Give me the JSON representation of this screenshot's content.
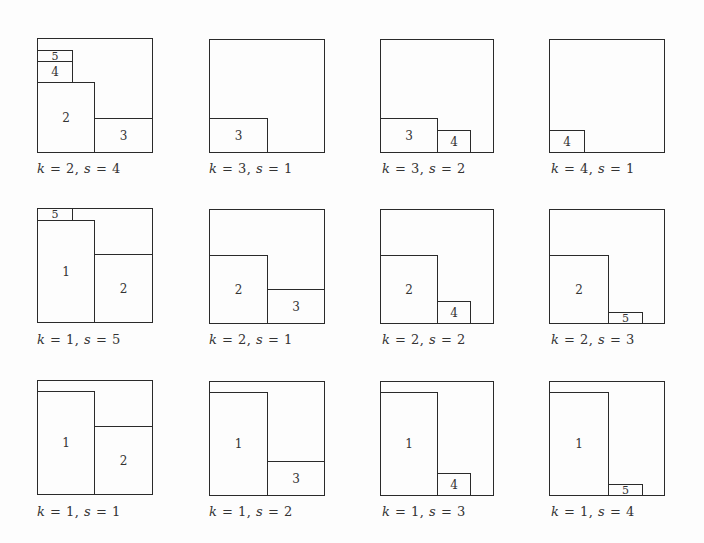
{
  "figure": {
    "panels": [
      {
        "caption": "k = 2, s = 4",
        "k": 2,
        "s": 4,
        "outer": {
          "x": 37,
          "y": 38,
          "w": 116,
          "h": 115
        },
        "rects": [
          {
            "label": "5",
            "x": 37,
            "y": 50,
            "w": 36,
            "h": 12
          },
          {
            "label": "4",
            "x": 37,
            "y": 61,
            "w": 36,
            "h": 22
          },
          {
            "label": "2",
            "x": 37,
            "y": 82,
            "w": 58,
            "h": 71
          },
          {
            "label": "3",
            "x": 94,
            "y": 118,
            "w": 59,
            "h": 35
          }
        ]
      },
      {
        "caption": "k = 3, s = 1",
        "k": 3,
        "s": 1,
        "outer": {
          "x": 209,
          "y": 39,
          "w": 116,
          "h": 114
        },
        "rects": [
          {
            "label": "3",
            "x": 209,
            "y": 118,
            "w": 59,
            "h": 35
          }
        ]
      },
      {
        "caption": "k = 3, s = 2",
        "k": 3,
        "s": 2,
        "outer": {
          "x": 380,
          "y": 39,
          "w": 114,
          "h": 114
        },
        "rects": [
          {
            "label": "3",
            "x": 380,
            "y": 118,
            "w": 58,
            "h": 35
          },
          {
            "label": "4",
            "x": 437,
            "y": 130,
            "w": 34,
            "h": 23
          }
        ]
      },
      {
        "caption": "k = 4, s = 1",
        "k": 4,
        "s": 1,
        "outer": {
          "x": 549,
          "y": 39,
          "w": 116,
          "h": 114
        },
        "rects": [
          {
            "label": "4",
            "x": 549,
            "y": 130,
            "w": 36,
            "h": 23
          }
        ]
      },
      {
        "caption": "k = 1, s = 5",
        "k": 1,
        "s": 5,
        "outer": {
          "x": 37,
          "y": 208,
          "w": 116,
          "h": 115
        },
        "rects": [
          {
            "label": "5",
            "x": 37,
            "y": 208,
            "w": 36,
            "h": 13
          },
          {
            "label": "1",
            "x": 37,
            "y": 220,
            "w": 58,
            "h": 103
          },
          {
            "label": "2",
            "x": 94,
            "y": 254,
            "w": 59,
            "h": 69
          }
        ]
      },
      {
        "caption": "k = 2, s = 1",
        "k": 2,
        "s": 1,
        "outer": {
          "x": 209,
          "y": 209,
          "w": 116,
          "h": 115
        },
        "rects": [
          {
            "label": "2",
            "x": 209,
            "y": 255,
            "w": 59,
            "h": 69
          },
          {
            "label": "3",
            "x": 267,
            "y": 289,
            "w": 58,
            "h": 35
          }
        ]
      },
      {
        "caption": "k = 2, s = 2",
        "k": 2,
        "s": 2,
        "outer": {
          "x": 380,
          "y": 209,
          "w": 114,
          "h": 115
        },
        "rects": [
          {
            "label": "2",
            "x": 380,
            "y": 255,
            "w": 58,
            "h": 69
          },
          {
            "label": "4",
            "x": 437,
            "y": 301,
            "w": 34,
            "h": 23
          }
        ]
      },
      {
        "caption": "k = 2, s = 3",
        "k": 2,
        "s": 3,
        "outer": {
          "x": 549,
          "y": 209,
          "w": 116,
          "h": 115
        },
        "rects": [
          {
            "label": "2",
            "x": 549,
            "y": 255,
            "w": 60,
            "h": 69
          },
          {
            "label": "5",
            "x": 608,
            "y": 312,
            "w": 35,
            "h": 12
          }
        ]
      },
      {
        "caption": "k = 1, s = 1",
        "k": 1,
        "s": 1,
        "outer": {
          "x": 37,
          "y": 380,
          "w": 116,
          "h": 115
        },
        "rects": [
          {
            "label": "1",
            "x": 37,
            "y": 391,
            "w": 58,
            "h": 104
          },
          {
            "label": "2",
            "x": 94,
            "y": 426,
            "w": 59,
            "h": 69
          }
        ]
      },
      {
        "caption": "k = 1, s = 2",
        "k": 1,
        "s": 2,
        "outer": {
          "x": 209,
          "y": 381,
          "w": 116,
          "h": 115
        },
        "rects": [
          {
            "label": "1",
            "x": 209,
            "y": 392,
            "w": 59,
            "h": 104
          },
          {
            "label": "3",
            "x": 267,
            "y": 461,
            "w": 58,
            "h": 35
          }
        ]
      },
      {
        "caption": "k = 1, s = 3",
        "k": 1,
        "s": 3,
        "outer": {
          "x": 380,
          "y": 381,
          "w": 114,
          "h": 115
        },
        "rects": [
          {
            "label": "1",
            "x": 380,
            "y": 392,
            "w": 58,
            "h": 104
          },
          {
            "label": "4",
            "x": 437,
            "y": 473,
            "w": 34,
            "h": 23
          }
        ]
      },
      {
        "caption": "k = 1, s = 4",
        "k": 1,
        "s": 4,
        "outer": {
          "x": 549,
          "y": 381,
          "w": 116,
          "h": 115
        },
        "rects": [
          {
            "label": "1",
            "x": 549,
            "y": 392,
            "w": 60,
            "h": 104
          },
          {
            "label": "5",
            "x": 608,
            "y": 484,
            "w": 35,
            "h": 12
          }
        ]
      }
    ],
    "caption_positions": [
      {
        "x": 37,
        "y": 161
      },
      {
        "x": 209,
        "y": 161
      },
      {
        "x": 382,
        "y": 161
      },
      {
        "x": 551,
        "y": 161
      },
      {
        "x": 37,
        "y": 332
      },
      {
        "x": 209,
        "y": 332
      },
      {
        "x": 382,
        "y": 332
      },
      {
        "x": 551,
        "y": 332
      },
      {
        "x": 37,
        "y": 504
      },
      {
        "x": 209,
        "y": 504
      },
      {
        "x": 382,
        "y": 504
      },
      {
        "x": 551,
        "y": 504
      }
    ]
  }
}
